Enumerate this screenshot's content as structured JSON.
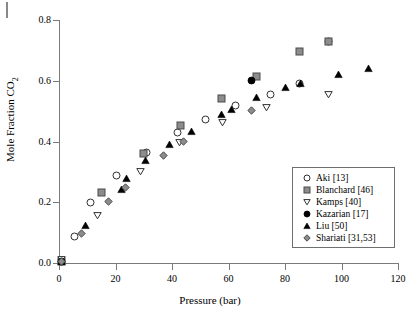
{
  "chart_data": {
    "type": "scatter",
    "title": "",
    "xlabel": "Pressure (bar)",
    "ylabel_text": "Mole Fraction CO",
    "ylabel_sub": "2",
    "xlim": [
      0,
      120
    ],
    "ylim": [
      0.0,
      0.8
    ],
    "xticks": [
      0,
      20,
      40,
      60,
      80,
      100,
      120
    ],
    "yticks": [
      "0.0",
      "0.2",
      "0.4",
      "0.6",
      "0.8"
    ],
    "ytick_values": [
      0.0,
      0.2,
      0.4,
      0.6,
      0.8
    ],
    "grid": false,
    "legend_position": "lower-right-inside",
    "series": [
      {
        "name": "Aki [13]",
        "marker": "open-circle",
        "color": "#ffffff",
        "edge": "#303030",
        "points": [
          [
            5.5,
            0.088
          ],
          [
            11.0,
            0.198
          ],
          [
            20.5,
            0.289
          ],
          [
            31.0,
            0.363
          ],
          [
            42.0,
            0.43
          ],
          [
            52.0,
            0.473
          ],
          [
            62.5,
            0.518
          ],
          [
            75.0,
            0.556
          ],
          [
            85.0,
            0.592
          ],
          [
            95.5,
            0.73
          ],
          [
            0.8,
            0.004
          ]
        ]
      },
      {
        "name": "Blanchard [46]",
        "marker": "filled-square",
        "color": "#8c8c8c",
        "edge": "#4a4a4a",
        "points": [
          [
            15.0,
            0.232
          ],
          [
            29.8,
            0.36
          ],
          [
            43.0,
            0.454
          ],
          [
            57.5,
            0.543
          ],
          [
            70.0,
            0.613
          ],
          [
            85.0,
            0.696
          ],
          [
            95.5,
            0.73
          ],
          [
            0.8,
            0.004
          ]
        ]
      },
      {
        "name": "Kamps [40]",
        "marker": "open-triangle-down",
        "color": "#ffffff",
        "edge": "#303030",
        "points": [
          [
            13.5,
            0.158
          ],
          [
            29.0,
            0.301
          ],
          [
            42.5,
            0.397
          ],
          [
            58.0,
            0.461
          ],
          [
            73.5,
            0.512
          ],
          [
            95.5,
            0.556
          ],
          [
            0.8,
            0.012
          ]
        ]
      },
      {
        "name": "Kazarian [17]",
        "marker": "filled-circle",
        "color": "#000000",
        "edge": "#000000",
        "points": [
          [
            68.0,
            0.6
          ],
          [
            0.8,
            0.004
          ]
        ]
      },
      {
        "name": "Liu [50]",
        "marker": "filled-triangle-up",
        "color": "#000000",
        "edge": "#000000",
        "points": [
          [
            9.5,
            0.122
          ],
          [
            22.0,
            0.243
          ],
          [
            24.0,
            0.278
          ],
          [
            30.5,
            0.336
          ],
          [
            39.0,
            0.391
          ],
          [
            47.0,
            0.432
          ],
          [
            57.5,
            0.49
          ],
          [
            61.0,
            0.504
          ],
          [
            70.0,
            0.545
          ],
          [
            80.0,
            0.577
          ],
          [
            85.5,
            0.591
          ],
          [
            99.0,
            0.619
          ],
          [
            109.5,
            0.64
          ],
          [
            0.8,
            0.004
          ]
        ]
      },
      {
        "name": "Shariati [31,53]",
        "marker": "filled-diamond",
        "color": "#8c8c8c",
        "edge": "#4a4a4a",
        "points": [
          [
            8.0,
            0.097
          ],
          [
            17.5,
            0.203
          ],
          [
            23.5,
            0.25
          ],
          [
            37.0,
            0.353
          ],
          [
            44.0,
            0.399
          ],
          [
            68.0,
            0.502
          ],
          [
            0.8,
            0.004
          ]
        ]
      }
    ]
  }
}
